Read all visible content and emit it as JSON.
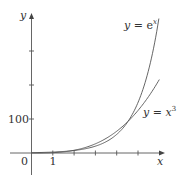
{
  "chart_data": {
    "type": "line",
    "title": "",
    "xlabel": "x",
    "ylabel": "y",
    "xlim": [
      0,
      6
    ],
    "ylim": [
      0,
      403
    ],
    "x_ticks": [
      1,
      2,
      3,
      4,
      5
    ],
    "x_tick_labels": [
      "0",
      "1"
    ],
    "y_ticks": [
      100,
      200,
      300
    ],
    "y_tick_labels": [
      "100"
    ],
    "grid": false,
    "series": [
      {
        "name": "y = e^x",
        "x": [
          0,
          1,
          2,
          3,
          4,
          4.5,
          5,
          5.5,
          6
        ],
        "values": [
          1,
          2.72,
          7.39,
          20.1,
          54.6,
          90.0,
          148.4,
          244.7,
          403.4
        ]
      },
      {
        "name": "y = x^3",
        "x": [
          0,
          1,
          2,
          3,
          4,
          4.5,
          5,
          5.5,
          6
        ],
        "values": [
          0,
          1,
          8,
          27,
          64,
          91.1,
          125,
          166.4,
          216
        ]
      }
    ],
    "annotations": [
      {
        "text": "y = e^x",
        "near_series": "y = e^x"
      },
      {
        "text": "y = x^3",
        "near_series": "y = x^3"
      }
    ]
  },
  "labels": {
    "origin": "0",
    "x_one": "1",
    "y_hundred": "100",
    "x_axis": "x",
    "y_axis": "y",
    "exp_label_lhs": "y",
    "exp_label_eq": " = e",
    "exp_label_sup": "x",
    "cube_label_lhs": "y",
    "cube_label_eq": " = x",
    "cube_label_sup": "3"
  },
  "colors": {
    "axis": "#555555",
    "curve": "#555555"
  }
}
